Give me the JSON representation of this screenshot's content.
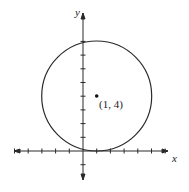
{
  "diagram": {
    "type": "circle-on-coordinate-plane",
    "x_axis_label": "x",
    "y_axis_label": "y",
    "center_label": "(1, 4)",
    "center": [
      1,
      4
    ],
    "radius": 4,
    "x_ticks": [
      -5,
      -4,
      -3,
      -2,
      -1,
      1,
      2,
      3,
      4,
      5,
      6
    ],
    "y_ticks": [
      -1,
      1,
      2,
      3,
      4,
      5,
      6,
      7,
      8
    ],
    "colors": {
      "stroke": "#2a2a2a",
      "background": "#ffffff"
    }
  }
}
